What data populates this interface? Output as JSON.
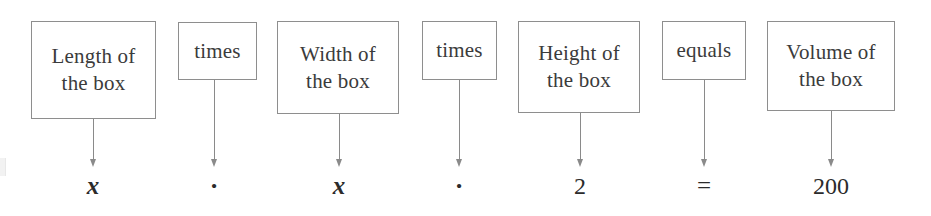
{
  "diagram": {
    "kind": "verbal-model-to-equation",
    "width": 931,
    "height": 216,
    "background_color": "#ffffff",
    "box_border_color": "#8e8e8e",
    "box_text_color": "#3b3b3b",
    "arrow_color": "#8a8a8a",
    "expression_text_color": "#2b2b2b"
  },
  "columns": [
    {
      "id": "length",
      "role": "quantity",
      "label": "Length of\nthe box",
      "label_line1": "Length of",
      "label_line2": "the box",
      "expression": "x",
      "expression_style": "italic-variable",
      "box": {
        "x": 31,
        "y": 21,
        "width": 125,
        "height": 98
      },
      "arrow": {
        "x": 93,
        "top": 119,
        "bottom": 167
      },
      "expression_center_x": 93
    },
    {
      "id": "times-1",
      "role": "operator",
      "label": "times",
      "label_line1": "times",
      "label_line2": "",
      "expression": "·",
      "expression_style": "operator-dot",
      "box": {
        "x": 178,
        "y": 22,
        "width": 79,
        "height": 58
      },
      "arrow": {
        "x": 214,
        "top": 80,
        "bottom": 167
      },
      "expression_center_x": 214
    },
    {
      "id": "width",
      "role": "quantity",
      "label": "Width of\nthe box",
      "label_line1": "Width of",
      "label_line2": "the box",
      "expression": "x",
      "expression_style": "italic-variable",
      "box": {
        "x": 277,
        "y": 21,
        "width": 122,
        "height": 93
      },
      "arrow": {
        "x": 339,
        "top": 114,
        "bottom": 167
      },
      "expression_center_x": 339
    },
    {
      "id": "times-2",
      "role": "operator",
      "label": "times",
      "label_line1": "times",
      "label_line2": "",
      "expression": "·",
      "expression_style": "operator-dot",
      "box": {
        "x": 422,
        "y": 21,
        "width": 75,
        "height": 59
      },
      "arrow": {
        "x": 459,
        "top": 80,
        "bottom": 167
      },
      "expression_center_x": 459
    },
    {
      "id": "height",
      "role": "quantity",
      "label": "Height of\nthe box",
      "label_line1": "Height of",
      "label_line2": "the box",
      "expression": "2",
      "expression_style": "number",
      "box": {
        "x": 518,
        "y": 21,
        "width": 122,
        "height": 92
      },
      "arrow": {
        "x": 580,
        "top": 113,
        "bottom": 167
      },
      "expression_center_x": 580
    },
    {
      "id": "equals",
      "role": "operator",
      "label": "equals",
      "label_line1": "equals",
      "label_line2": "",
      "expression": "=",
      "expression_style": "operator-equals",
      "box": {
        "x": 662,
        "y": 21,
        "width": 84,
        "height": 59
      },
      "arrow": {
        "x": 704,
        "top": 80,
        "bottom": 167
      },
      "expression_center_x": 704
    },
    {
      "id": "volume",
      "role": "quantity",
      "label": "Volume of\nthe box",
      "label_line1": "Volume of",
      "label_line2": "the box",
      "expression": "200",
      "expression_style": "number",
      "box": {
        "x": 767,
        "y": 21,
        "width": 128,
        "height": 90
      },
      "arrow": {
        "x": 831,
        "top": 111,
        "bottom": 167
      },
      "expression_center_x": 831
    }
  ],
  "equation_reading": "x · x · 2 = 200",
  "verbal_model_reading": "Length of the box times Width of the box times Height of the box equals Volume of the box"
}
